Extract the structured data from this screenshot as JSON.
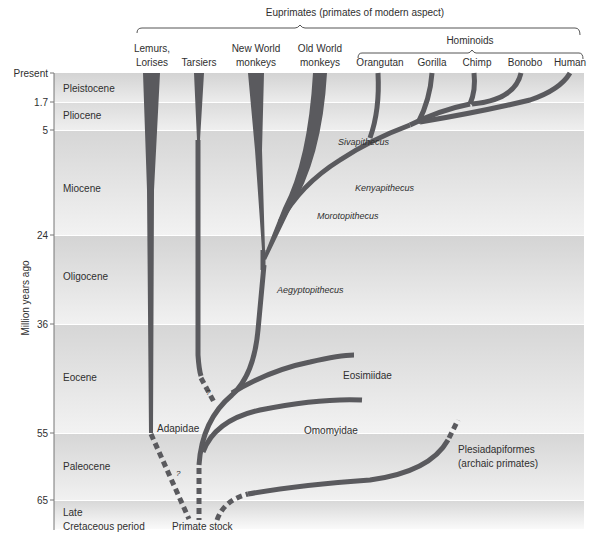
{
  "header": {
    "euprimates_label": "Euprimates (primates of modern aspect)",
    "hominoids_label": "Hominoids"
  },
  "taxa": {
    "lemurs_line1": "Lemurs,",
    "lemurs_line2": "Lorises",
    "tarsiers": "Tarsiers",
    "nwm_line1": "New World",
    "nwm_line2": "monkeys",
    "owm_line1": "Old World",
    "owm_line2": "monkeys",
    "orangutan": "Orangutan",
    "gorilla": "Gorilla",
    "chimp": "Chimp",
    "bonobo": "Bonobo",
    "human": "Human"
  },
  "axis": {
    "title": "Million years ago",
    "ticks": [
      "Present",
      "1.7",
      "5",
      "24",
      "36",
      "55",
      "65"
    ]
  },
  "epochs": {
    "pleistocene": "Pleistocene",
    "pliocene": "Pliocene",
    "miocene": "Miocene",
    "oligocene": "Oligocene",
    "eocene": "Eocene",
    "paleocene": "Paleocene",
    "late": "Late",
    "cretaceous": "Cretaceous period"
  },
  "fossils": {
    "sivapithecus": "Sivapithecus",
    "kenyapithecus": "Kenyapithecus",
    "morotopithecus": "Morotopithecus",
    "aegyptopithecus": "Aegyptopithecus",
    "eosimiidae": "Eosimiidae",
    "omomyidae": "Omomyidae",
    "adapidae": "Adapidae",
    "plesiadapiformes_line1": "Plesiadapiformes",
    "plesiadapiformes_line2": "(archaic primates)",
    "primate_stock": "Primate stock",
    "uncertain_mark": "?"
  },
  "colors": {
    "branch": "#5a5a5e",
    "band_dark": "#d6d6d6",
    "band_light": "#f0f0f0",
    "text": "#2f2f2f"
  }
}
